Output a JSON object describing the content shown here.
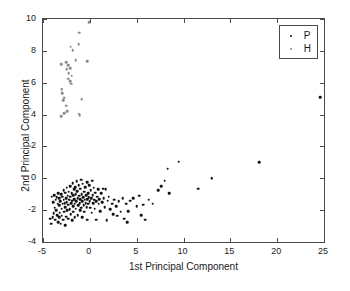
{
  "chart_data": {
    "type": "scatter",
    "title": "",
    "xlabel": "1st Principal Component",
    "ylabel": "2nd Principal Component",
    "xlim": [
      -5,
      25
    ],
    "ylim": [
      -4,
      10
    ],
    "xticks": [
      -5,
      0,
      5,
      10,
      15,
      20,
      25
    ],
    "yticks": [
      -4,
      -2,
      0,
      2,
      4,
      6,
      8,
      10
    ],
    "xticklabels": [
      "-5",
      "0",
      "5",
      "10",
      "15",
      "20",
      "25"
    ],
    "yticklabels": [
      "-4",
      "-2",
      "0",
      "2",
      "4",
      "6",
      "8",
      "10"
    ],
    "grid": false,
    "legend_position": "upper right",
    "series": [
      {
        "name": "P",
        "color": "#111111",
        "marker": "dot",
        "points": [
          [
            -4.25,
            -2.55
          ],
          [
            -4.15,
            -2.85
          ],
          [
            -4.05,
            -1.15
          ],
          [
            -3.95,
            -2.45
          ],
          [
            -3.9,
            -1.5
          ],
          [
            -3.85,
            -2.2
          ],
          [
            -3.8,
            -1.05
          ],
          [
            -3.75,
            -1.85
          ],
          [
            -3.7,
            -2.6
          ],
          [
            -3.65,
            -1.35
          ],
          [
            -3.6,
            -2.0
          ],
          [
            -3.55,
            -1.2
          ],
          [
            -3.5,
            -2.3
          ],
          [
            -3.45,
            -1.6
          ],
          [
            -3.4,
            -2.75
          ],
          [
            -3.35,
            -0.95
          ],
          [
            -3.3,
            -1.7
          ],
          [
            -3.3,
            -2.45
          ],
          [
            -3.25,
            -1.25
          ],
          [
            -3.2,
            -2.15
          ],
          [
            -3.15,
            -1.45
          ],
          [
            -3.1,
            -2.85
          ],
          [
            -3.05,
            -1.0
          ],
          [
            -3.0,
            -1.9
          ],
          [
            -3.0,
            -2.35
          ],
          [
            -2.95,
            -1.15
          ],
          [
            -2.9,
            -1.6
          ],
          [
            -2.85,
            -2.6
          ],
          [
            -2.8,
            -0.75
          ],
          [
            -2.8,
            -1.35
          ],
          [
            -2.75,
            -2.1
          ],
          [
            -2.7,
            -1.55
          ],
          [
            -2.65,
            -2.95
          ],
          [
            -2.6,
            -0.9
          ],
          [
            -2.6,
            -1.8
          ],
          [
            -2.55,
            -1.25
          ],
          [
            -2.5,
            -2.4
          ],
          [
            -2.45,
            -0.6
          ],
          [
            -2.45,
            -1.5
          ],
          [
            -2.4,
            -2.0
          ],
          [
            -2.35,
            -1.1
          ],
          [
            -2.3,
            -1.65
          ],
          [
            -2.3,
            -2.55
          ],
          [
            -2.25,
            -0.85
          ],
          [
            -2.2,
            -1.35
          ],
          [
            -2.15,
            -1.95
          ],
          [
            -2.1,
            -0.5
          ],
          [
            -2.1,
            -1.15
          ],
          [
            -2.05,
            -2.25
          ],
          [
            -2.0,
            -1.55
          ],
          [
            -1.95,
            -0.95
          ],
          [
            -1.9,
            -1.4
          ],
          [
            -1.9,
            -2.65
          ],
          [
            -1.85,
            -0.3
          ],
          [
            -1.8,
            -1.05
          ],
          [
            -1.8,
            -1.75
          ],
          [
            -1.75,
            -2.1
          ],
          [
            -1.7,
            -0.7
          ],
          [
            -1.65,
            -1.3
          ],
          [
            -1.6,
            -1.6
          ],
          [
            -1.6,
            -2.45
          ],
          [
            -1.55,
            -0.55
          ],
          [
            -1.5,
            -1.0
          ],
          [
            -1.5,
            -1.9
          ],
          [
            -1.45,
            -1.45
          ],
          [
            -1.4,
            -0.2
          ],
          [
            -1.35,
            -0.8
          ],
          [
            -1.3,
            -1.25
          ],
          [
            -1.3,
            -2.3
          ],
          [
            -1.25,
            -1.7
          ],
          [
            -1.2,
            -0.45
          ],
          [
            -1.15,
            -1.1
          ],
          [
            -1.1,
            -1.55
          ],
          [
            -1.05,
            -2.0
          ],
          [
            -1.0,
            -0.65
          ],
          [
            -1.0,
            -1.3
          ],
          [
            -0.95,
            -1.85
          ],
          [
            -0.9,
            -0.1
          ],
          [
            -0.85,
            -1.0
          ],
          [
            -0.8,
            -1.45
          ],
          [
            -0.8,
            -2.45
          ],
          [
            -0.75,
            -0.35
          ],
          [
            -0.7,
            -1.2
          ],
          [
            -0.65,
            -1.7
          ],
          [
            -0.6,
            -0.85
          ],
          [
            -0.6,
            -2.1
          ],
          [
            -0.55,
            -1.35
          ],
          [
            -0.5,
            -0.55
          ],
          [
            -0.45,
            -1.55
          ],
          [
            -0.4,
            -1.05
          ],
          [
            -0.35,
            -1.8
          ],
          [
            -0.3,
            -0.25
          ],
          [
            -0.3,
            -1.3
          ],
          [
            -0.25,
            -2.6
          ],
          [
            -0.2,
            -0.95
          ],
          [
            -0.15,
            -1.6
          ],
          [
            -0.1,
            -1.2
          ],
          [
            -0.05,
            -0.45
          ],
          [
            0.0,
            -1.45
          ],
          [
            0.05,
            -1.85
          ],
          [
            0.1,
            -0.75
          ],
          [
            0.15,
            -1.25
          ],
          [
            0.2,
            -2.15
          ],
          [
            0.25,
            -0.15
          ],
          [
            0.3,
            -1.05
          ],
          [
            0.35,
            -1.55
          ],
          [
            0.4,
            -0.6
          ],
          [
            0.45,
            -1.35
          ],
          [
            0.5,
            -1.9
          ],
          [
            0.6,
            -0.9
          ],
          [
            0.65,
            -1.45
          ],
          [
            0.7,
            -2.6
          ],
          [
            0.8,
            -1.15
          ],
          [
            0.9,
            -0.7
          ],
          [
            0.95,
            -1.6
          ],
          [
            1.0,
            -1.3
          ],
          [
            1.1,
            -2.05
          ],
          [
            1.2,
            -0.95
          ],
          [
            1.3,
            -1.5
          ],
          [
            1.4,
            -0.65
          ],
          [
            1.5,
            -1.25
          ],
          [
            1.6,
            -1.8
          ],
          [
            1.7,
            -0.7
          ],
          [
            1.8,
            -2.65
          ],
          [
            1.9,
            -1.4
          ],
          [
            2.0,
            -1.15
          ],
          [
            2.2,
            -1.95
          ],
          [
            2.4,
            -1.6
          ],
          [
            2.5,
            -2.25
          ],
          [
            2.6,
            -1.35
          ],
          [
            2.8,
            -1.75
          ],
          [
            2.9,
            -2.35
          ],
          [
            3.1,
            -1.45
          ],
          [
            3.3,
            -2.1
          ],
          [
            3.5,
            -1.25
          ],
          [
            3.7,
            -2.55
          ],
          [
            3.9,
            -1.6
          ],
          [
            4.0,
            -2.75
          ],
          [
            4.1,
            -2.05
          ],
          [
            4.3,
            -1.4
          ],
          [
            4.6,
            -1.25
          ],
          [
            5.0,
            -1.75
          ],
          [
            5.3,
            -1.1
          ],
          [
            5.5,
            -2.3
          ],
          [
            5.7,
            -1.65
          ],
          [
            5.9,
            -2.6
          ],
          [
            6.3,
            -1.35
          ],
          [
            6.7,
            -1.6
          ],
          [
            7.3,
            -0.75
          ],
          [
            7.6,
            -0.5
          ],
          [
            8.0,
            -0.15
          ],
          [
            8.3,
            0.6
          ],
          [
            8.5,
            -0.95
          ],
          [
            9.5,
            1.05
          ],
          [
            11.6,
            -0.65
          ],
          [
            13.0,
            0.0
          ],
          [
            18.1,
            1.0
          ],
          [
            24.6,
            5.1
          ]
        ]
      },
      {
        "name": "H",
        "color": "#8a8a8a",
        "marker": "dot",
        "points": [
          [
            -0.05,
            9.8
          ],
          [
            -1.15,
            9.15
          ],
          [
            -2.05,
            8.25
          ],
          [
            -1.2,
            8.4
          ],
          [
            -1.85,
            8.05
          ],
          [
            -3.05,
            7.15
          ],
          [
            -2.5,
            7.3
          ],
          [
            -2.3,
            7.1
          ],
          [
            -1.5,
            7.4
          ],
          [
            -0.3,
            7.35
          ],
          [
            -2.45,
            6.85
          ],
          [
            -2.1,
            6.9
          ],
          [
            -2.25,
            6.6
          ],
          [
            -1.95,
            6.45
          ],
          [
            -2.3,
            6.25
          ],
          [
            -2.1,
            6.1
          ],
          [
            -2.0,
            5.95
          ],
          [
            -3.0,
            5.6
          ],
          [
            -2.95,
            5.35
          ],
          [
            -2.75,
            5.05
          ],
          [
            -2.85,
            4.9
          ],
          [
            -0.85,
            4.95
          ],
          [
            -2.55,
            4.55
          ],
          [
            -2.75,
            4.1
          ],
          [
            -2.4,
            4.2
          ],
          [
            -3.05,
            3.9
          ],
          [
            -1.2,
            4.05
          ],
          [
            -1.1,
            3.95
          ]
        ]
      }
    ]
  },
  "legend": {
    "entries": [
      {
        "marker_color": "#111111",
        "label": "P"
      },
      {
        "marker_color": "#8a8a8a",
        "label": "H"
      }
    ]
  }
}
